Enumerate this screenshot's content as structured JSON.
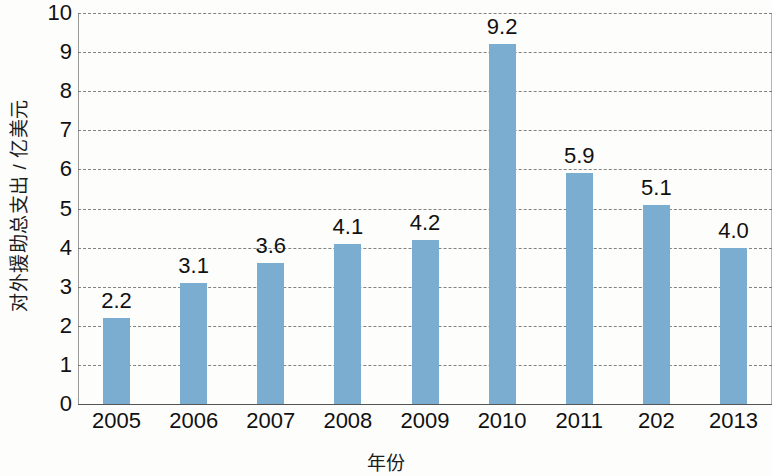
{
  "chart_data": {
    "type": "bar",
    "title": "",
    "xlabel": "年份",
    "ylabel": "对外援助总支出 / 亿美元",
    "categories": [
      "2005",
      "2006",
      "2007",
      "2008",
      "2009",
      "2010",
      "2011",
      "202",
      "2013"
    ],
    "values": [
      2.2,
      3.1,
      3.6,
      4.1,
      4.2,
      9.2,
      5.9,
      5.1,
      4.0
    ],
    "value_labels": [
      "2.2",
      "3.1",
      "3.6",
      "4.1",
      "4.2",
      "9.2",
      "5.9",
      "5.1",
      "4.0"
    ],
    "ylim": [
      0,
      10
    ],
    "y_ticks": [
      10,
      9,
      8,
      7,
      6,
      5,
      4,
      3,
      2,
      1,
      0
    ],
    "y_tick_labels": [
      "10",
      "9",
      "8",
      "7",
      "6",
      "5",
      "4",
      "3",
      "2",
      "1",
      "0"
    ],
    "grid": true,
    "grid_axis": "y",
    "legend": false,
    "legend_position": "none",
    "bar_color": "#7aadcf",
    "grid_color": "#6d6d6d",
    "axis_color": "#555555",
    "text_color": "#111111"
  }
}
